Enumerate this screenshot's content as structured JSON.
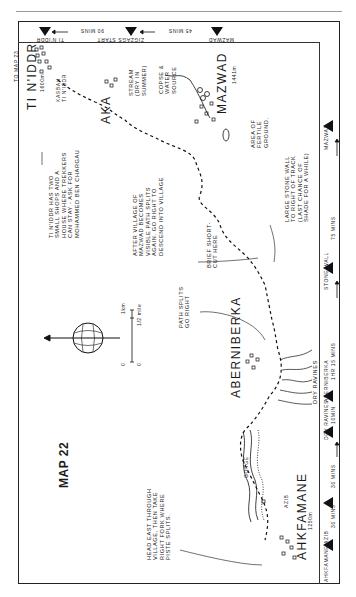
{
  "map": {
    "title": "MAP 22",
    "top_strip": {
      "waypoints": [
        "TI N'IDDR",
        "ZIGZAGS START",
        "MAZWAD"
      ],
      "timings": [
        "90 MINS",
        "45 MINS"
      ]
    },
    "right_strip": {
      "waypoints": [
        "AHKFAMANE AZIB",
        "DRY RAVINES",
        "ABERNIBERKA",
        "STONE WALL",
        "MAZWAD"
      ],
      "timings": [
        "30 MINS",
        "30 MINS",
        "10MIN",
        "1HR 15 MINS",
        "75 MINS"
      ]
    },
    "places": {
      "tinidr": {
        "name": "TI N'IDDR",
        "alt": "1600m"
      },
      "kasbah": "KASBAH TI N'IDDR",
      "aka": "AKA",
      "mazwad": {
        "name": "MAZWAD",
        "alt": "1441m"
      },
      "aberniberka": "ABERNIBERKA",
      "ahkfamane": {
        "name": "AHKFAMANE",
        "alt": "1250m"
      },
      "azib": "AZIB",
      "gorge": "GORGE",
      "to_map": "TO MAP 23"
    },
    "notes": {
      "stream": [
        "STREAM",
        "(DRY IN",
        "SUMMER)"
      ],
      "copse": [
        "COPSE &",
        "WATER",
        "SOURCE"
      ],
      "fertile": [
        "AREA OF",
        "FERTILE",
        "GROUND."
      ],
      "tinidr_info": [
        "TI N'IDDR HAS TWO",
        "SMALL SHOPS AND A",
        "HOUSE WHERE TREKKERS",
        "CAN STAY - ASK FOR",
        "MOHAMMED BEN CHARGAU"
      ],
      "after_village": [
        "AFTER  VILLAGE OF",
        "MAZWAD  BECOMES",
        "VISIBLE  PATH SPLITS",
        "AGAIN. GO RIGHT TO",
        "DESCEND INTO VILLAGE"
      ],
      "shortcut": [
        "BRIEF SHORT-",
        "CUT HERE"
      ],
      "stone_wall": [
        "LARGE STONE WALL",
        "TO RIGHT OF TRACK",
        "(LAST CHANCE OF",
        "SHADE FOR A WHILE)"
      ],
      "path_splits": [
        "PATH SPLITS",
        "GO RIGHT"
      ],
      "dry_ravines": "DRY RAVINES",
      "head_east": [
        "HEAD EAST THROUGH",
        "VILLAGE, THEN TAKE",
        "RIGHT FORK WHERE",
        "PISTE SPLITS."
      ]
    },
    "scale": {
      "km": "1km",
      "mile": "1/2 mile",
      "zero_km": "0",
      "zero_mile": "0"
    },
    "compass": "north-arrow-globe"
  }
}
